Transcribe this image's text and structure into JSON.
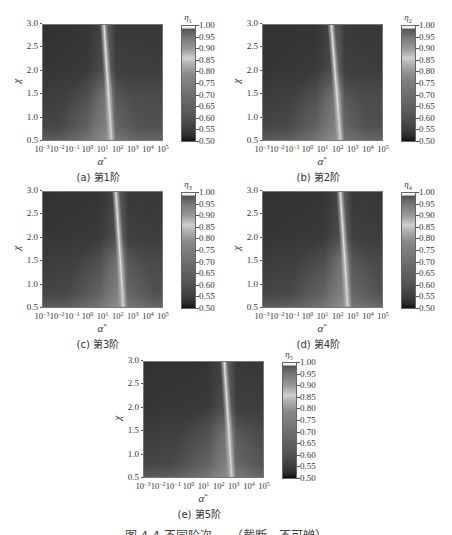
{
  "chart_data": [
    {
      "type": "heatmap",
      "panel": "a",
      "caption": "(a)  第1阶",
      "title": "",
      "xlabel": "α*",
      "ylabel": "χ",
      "xscale": "log",
      "xlim": [
        0.001,
        100000
      ],
      "ylim": [
        0.5,
        3.0
      ],
      "xticks": [
        "10^-3",
        "10^-2",
        "10^-1",
        "10^0",
        "10^1",
        "10^2",
        "10^3",
        "10^4",
        "10^5"
      ],
      "yticks": [
        "0.5",
        "1.0",
        "1.5",
        "2.0",
        "2.5",
        "3.0"
      ],
      "colorbar": {
        "label": "η1",
        "min": 0.5,
        "max": 1.0,
        "ticks": [
          "1.00",
          "0.95",
          "0.90",
          "0.85",
          "0.80",
          "0.75",
          "0.70",
          "0.65",
          "0.60",
          "0.55",
          "0.50"
        ]
      },
      "ridge_log10_alpha_top": 1.6,
      "ridge_log10_alpha_bottom": 1.1,
      "ridge_value": 0.85
    },
    {
      "type": "heatmap",
      "panel": "b",
      "caption": "(b)  第2阶",
      "xlabel": "α*",
      "ylabel": "χ",
      "xscale": "log",
      "xlim": [
        0.001,
        100000
      ],
      "ylim": [
        0.5,
        3.0
      ],
      "xticks": [
        "10^-3",
        "10^-2",
        "10^-1",
        "10^0",
        "10^1",
        "10^2",
        "10^3",
        "10^4",
        "10^5"
      ],
      "yticks": [
        "0.5",
        "1.0",
        "1.5",
        "2.0",
        "2.5",
        "3.0"
      ],
      "colorbar": {
        "label": "η2",
        "min": 0.5,
        "max": 1.0,
        "ticks": [
          "1.00",
          "0.95",
          "0.90",
          "0.85",
          "0.80",
          "0.75",
          "0.70",
          "0.65",
          "0.60",
          "0.55",
          "0.50"
        ]
      },
      "ridge_log10_alpha_top": 2.2,
      "ridge_log10_alpha_bottom": 1.6,
      "ridge_value": 0.85
    },
    {
      "type": "heatmap",
      "panel": "c",
      "caption": "(c)  第3阶",
      "xlabel": "α*",
      "ylabel": "χ",
      "xscale": "log",
      "xlim": [
        0.001,
        100000
      ],
      "ylim": [
        0.5,
        3.0
      ],
      "xticks": [
        "10^-3",
        "10^-2",
        "10^-1",
        "10^0",
        "10^1",
        "10^2",
        "10^3",
        "10^4",
        "10^5"
      ],
      "yticks": [
        "0.5",
        "1.0",
        "1.5",
        "2.0",
        "2.5",
        "3.0"
      ],
      "colorbar": {
        "label": "η3",
        "min": 0.5,
        "max": 1.0,
        "ticks": [
          "1.00",
          "0.95",
          "0.90",
          "0.85",
          "0.80",
          "0.75",
          "0.70",
          "0.65",
          "0.60",
          "0.55",
          "0.50"
        ]
      },
      "ridge_log10_alpha_top": 2.4,
      "ridge_log10_alpha_bottom": 1.9,
      "ridge_value": 0.85
    },
    {
      "type": "heatmap",
      "panel": "d",
      "caption": "(d)  第4阶",
      "xlabel": "α*",
      "ylabel": "χ",
      "xscale": "log",
      "xlim": [
        0.001,
        100000
      ],
      "ylim": [
        0.5,
        3.0
      ],
      "xticks": [
        "10^-3",
        "10^-2",
        "10^-1",
        "10^0",
        "10^1",
        "10^2",
        "10^3",
        "10^4",
        "10^5"
      ],
      "yticks": [
        "0.5",
        "1.0",
        "1.5",
        "2.0",
        "2.5",
        "3.0"
      ],
      "colorbar": {
        "label": "η4",
        "min": 0.5,
        "max": 1.0,
        "ticks": [
          "1.00",
          "0.95",
          "0.90",
          "0.85",
          "0.80",
          "0.75",
          "0.70",
          "0.65",
          "0.60",
          "0.55",
          "0.50"
        ]
      },
      "ridge_log10_alpha_top": 2.7,
      "ridge_log10_alpha_bottom": 2.2,
      "ridge_value": 0.85
    },
    {
      "type": "heatmap",
      "panel": "e",
      "caption": "(e)  第5阶",
      "xlabel": "α*",
      "ylabel": "χ",
      "xscale": "log",
      "xlim": [
        0.001,
        100000
      ],
      "ylim": [
        0.5,
        3.0
      ],
      "xticks": [
        "10^-3",
        "10^-2",
        "10^-1",
        "10^0",
        "10^1",
        "10^2",
        "10^3",
        "10^4",
        "10^5"
      ],
      "yticks": [
        "0.5",
        "1.0",
        "1.5",
        "2.0",
        "2.5",
        "3.0"
      ],
      "colorbar": {
        "label": "η5",
        "min": 0.5,
        "max": 1.0,
        "ticks": [
          "1.00",
          "0.95",
          "0.90",
          "0.85",
          "0.80",
          "0.75",
          "0.70",
          "0.65",
          "0.60",
          "0.55",
          "0.50"
        ]
      },
      "ridge_log10_alpha_top": 2.9,
      "ridge_log10_alpha_bottom": 2.4,
      "ridge_value": 0.85
    }
  ],
  "figure": {
    "caption_partial": "图 4-4  不同阶次 … （截断，不可辨）"
  },
  "layout": {
    "panels": [
      {
        "left": 0,
        "top": 0
      },
      {
        "left": 220,
        "top": 0
      },
      {
        "left": 0,
        "top": 167
      },
      {
        "left": 220,
        "top": 167
      },
      {
        "left": 101,
        "top": 337
      }
    ]
  }
}
